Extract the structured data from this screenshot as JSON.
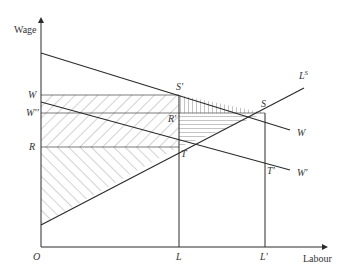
{
  "diagram": {
    "type": "labour-market-wage-diagram",
    "axes": {
      "y_label": "Wage",
      "x_label": "Labour",
      "origin_label": "O"
    },
    "y_ticks": [
      {
        "label": "W",
        "level": "W"
      },
      {
        "label": "W''",
        "level": "W''"
      },
      {
        "label": "R",
        "level": "R"
      }
    ],
    "x_ticks": [
      {
        "label": "L"
      },
      {
        "label": "L'"
      }
    ],
    "curves": [
      {
        "name": "W",
        "label": "W",
        "description": "downward-sloping wage line"
      },
      {
        "name": "W'",
        "label": "W'",
        "description": "lower downward-sloping wage line"
      },
      {
        "name": "LS",
        "label": "L",
        "superscript": "S",
        "description": "upward-sloping labour supply"
      }
    ],
    "points": [
      {
        "label": "S'"
      },
      {
        "label": "S"
      },
      {
        "label": "R'"
      },
      {
        "label": "T"
      },
      {
        "label": "T'"
      }
    ],
    "shaded_regions": [
      "diagonal hatch (/) rectangle between W and R from O to L",
      "diagonal hatch (\\) triangle between R and L^S from O to T",
      "vertical hatch triangle S'-S between W line and W horizontal",
      "horizontal hatch triangle R'-S-T between W'' and L^S"
    ]
  },
  "colors": {
    "line": "#2b2b2b",
    "hatch": "#555555",
    "background": "#ffffff"
  }
}
